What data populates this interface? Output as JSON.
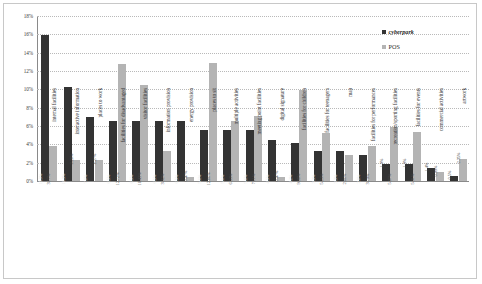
{
  "chart_data": {
    "type": "bar",
    "title": "",
    "xlabel": "",
    "ylabel": "",
    "ylim": [
      0,
      18
    ],
    "ytick_labels": [
      "18%",
      "16%",
      "14%",
      "12%",
      "10%",
      "8%",
      "6%",
      "4%",
      "2%",
      "0%"
    ],
    "ytick_values": [
      18,
      16,
      14,
      12,
      10,
      8,
      6,
      4,
      2,
      0
    ],
    "grid": true,
    "legend_position": "top-right",
    "categories": [
      "internal facilities",
      "interactive information",
      "places to work",
      "facilities for disadvantaged",
      "visitor facilities",
      "information provision",
      "energy provision",
      "places to sit",
      "multiple activities",
      "meeting point facilities",
      "digital signature",
      "facilities for children",
      "facilities for teenagers",
      "map",
      "facilities for performances",
      "recreation/sporting facilities",
      "facilities for events",
      "commercial activities",
      "artwork"
    ],
    "series": [
      {
        "name": "cyberpark",
        "color": "#333333",
        "values": [
          15.9,
          10.3,
          7.0,
          6.5,
          6.5,
          6.5,
          6.5,
          5.6,
          5.6,
          5.6,
          4.5,
          4.2,
          3.3,
          3.3,
          2.8,
          1.9,
          1.9,
          1.4,
          0.5
        ],
        "labels": [
          "15.9%",
          "10.3%",
          "7.0%",
          "6.5%",
          "6.5%",
          "6.5%",
          "6.5%",
          "5.6%",
          "5.6%",
          "5.6%",
          "4.5%",
          "4.2%",
          "3.3%",
          "3.3%",
          "2.8%",
          "1.9%",
          "1.9%",
          "1.4%",
          "0.5%"
        ]
      },
      {
        "name": "POS",
        "color": "#b4b4b4",
        "values": [
          3.77,
          2.28,
          2.27,
          12.72,
          10.43,
          3.32,
          0.47,
          12.86,
          6.53,
          7.11,
          0.47,
          9.98,
          5.23,
          2.86,
          3.79,
          5.87,
          5.31,
          0.99,
          2.35
        ],
        "labels": [
          "3.77%",
          "2.28%",
          "2.27%",
          "12.72%",
          "10.43%",
          "3.32%",
          "0.47%",
          "12.86%",
          "6.53%",
          "7.11%",
          "0.47%",
          "9.98%",
          "5.23%",
          "2.86%",
          "3.79%",
          "5.87%",
          "5.31%",
          "0.99%",
          "2.35%"
        ]
      }
    ]
  },
  "legend": {
    "items": [
      {
        "label": "cyberpark",
        "color": "#333333"
      },
      {
        "label": "POS",
        "color": "#b4b4b4"
      }
    ]
  }
}
